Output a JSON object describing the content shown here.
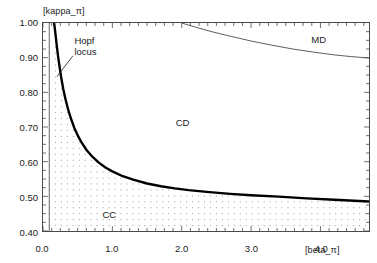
{
  "chart_data": {
    "type": "line",
    "title": "",
    "xlabel": "[beta_π]",
    "ylabel": "[kappa_π]",
    "xlim": [
      0.0,
      4.7
    ],
    "ylim": [
      0.4,
      1.0
    ],
    "grid": false,
    "legend": "none",
    "xticks": [
      0.0,
      1.0,
      2.0,
      3.0,
      4.0
    ],
    "xtick_labels": [
      "0.0",
      "1.0",
      "2.0",
      "3.0",
      "4.0"
    ],
    "yticks": [
      0.4,
      0.5,
      0.6,
      0.7,
      0.8,
      0.9,
      1.0
    ],
    "ytick_labels": [
      "0.40",
      "0.50",
      "0.60",
      "0.70",
      "0.80",
      "0.90",
      "1.00"
    ],
    "minor_ticks": {
      "x_interval": 0.125,
      "y_interval": 0.025
    },
    "series": [
      {
        "name": "Hopf locus",
        "style": "thick-solid",
        "color": "#000000",
        "width_px": 2.4,
        "x": [
          0.16,
          0.17,
          0.18,
          0.19,
          0.2,
          0.22,
          0.24,
          0.26,
          0.29,
          0.32,
          0.36,
          0.4,
          0.45,
          0.5,
          0.56,
          0.63,
          0.7,
          0.8,
          0.9,
          1.0,
          1.15,
          1.3,
          1.5,
          1.7,
          1.9,
          2.1,
          2.4,
          2.7,
          3.0,
          3.4,
          3.8,
          4.2,
          4.7
        ],
        "y": [
          1.0,
          0.985,
          0.968,
          0.95,
          0.932,
          0.9,
          0.872,
          0.846,
          0.812,
          0.784,
          0.752,
          0.726,
          0.698,
          0.676,
          0.654,
          0.633,
          0.617,
          0.598,
          0.583,
          0.572,
          0.558,
          0.548,
          0.537,
          0.529,
          0.523,
          0.518,
          0.512,
          0.507,
          0.503,
          0.499,
          0.494,
          0.49,
          0.485
        ]
      },
      {
        "name": "CD-MD boundary",
        "style": "thin-solid",
        "color": "#4a4a4a",
        "width_px": 0.9,
        "x": [
          2.0,
          2.2,
          2.45,
          2.7,
          3.0,
          3.3,
          3.6,
          3.9,
          4.2,
          4.45,
          4.7
        ],
        "y": [
          1.0,
          0.988,
          0.974,
          0.962,
          0.948,
          0.936,
          0.925,
          0.916,
          0.908,
          0.903,
          0.899
        ]
      }
    ],
    "shaded_regions": [
      {
        "name": "CC dotted region",
        "fill": "dotted",
        "dot_color": "#9a9a9a",
        "description": "dotted fill below the Hopf locus, from beta=0.09 to right edge"
      }
    ],
    "region_labels": [
      {
        "text": "CC",
        "x": 0.95,
        "y": 0.455
      },
      {
        "text": "CD",
        "x": 2.0,
        "y": 0.718
      },
      {
        "text": "MD",
        "x": 3.95,
        "y": 0.955
      }
    ],
    "annotations": [
      {
        "name": "hopf-locus-annotation",
        "line1": "Hopf",
        "line2": "locus",
        "text_x": 0.45,
        "text_y": 0.965,
        "leader_from_x": 0.43,
        "leader_from_y": 0.905,
        "leader_to_x": 0.2,
        "leader_to_y": 0.845
      }
    ],
    "vertical_marker": {
      "name": "left-vertical-line",
      "x": 0.09,
      "y_from": 0.4,
      "y_to": 1.0,
      "color": "#555555"
    }
  }
}
